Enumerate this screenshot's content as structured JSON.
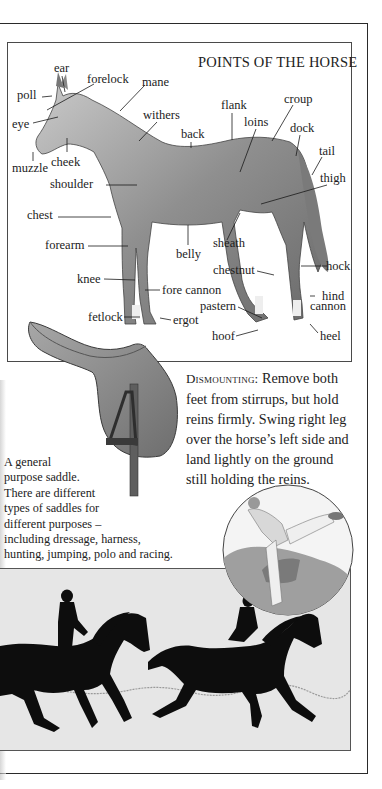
{
  "diagram": {
    "title": "POINTS OF THE HORSE",
    "labels": {
      "ear": "ear",
      "forelock": "forelock",
      "mane": "mane",
      "poll": "poll",
      "eye": "eye",
      "withers": "withers",
      "flank": "flank",
      "croup": "croup",
      "loins": "loins",
      "dock": "dock",
      "back": "back",
      "tail": "tail",
      "muzzle": "muzzle",
      "cheek": "cheek",
      "thigh": "thigh",
      "shoulder": "shoulder",
      "chest": "chest",
      "forearm": "forearm",
      "belly": "belly",
      "sheath": "sheath",
      "chestnut": "chestnut",
      "hock": "hock",
      "knee": "knee",
      "fore_cannon": "fore cannon",
      "hind": "hind",
      "cannon": "cannon",
      "pastern": "pastern",
      "fetlock": "fetlock",
      "ergot": "ergot",
      "hoof": "hoof",
      "heel": "heel"
    }
  },
  "saddle": {
    "caption_lines": [
      "A general",
      "purpose saddle.",
      "There are different",
      "types of saddles for",
      "different purposes –",
      "including dressage, harness,",
      "hunting, jumping, polo and racing."
    ]
  },
  "dismounting": {
    "heading": "Dismounting:",
    "body": "Remove both feet from stirrups, but hold reins firmly. Swing right leg over the horse’s left side and land lightly on the ground still holding the reins."
  },
  "colors": {
    "ink": "#1a1a1a",
    "horse_shade": "#9a9a9a",
    "saddle_leather": "#8a8a8a",
    "silhouette_bg": "#e6e6e6"
  }
}
